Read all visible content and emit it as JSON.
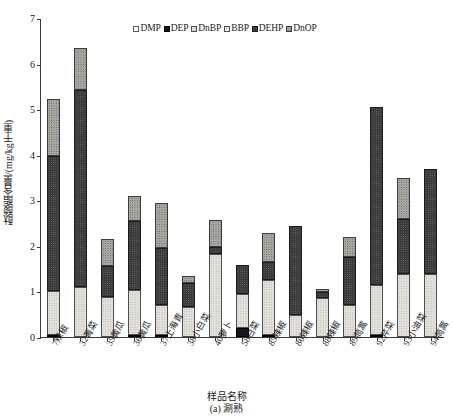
{
  "chart_data": {
    "type": "bar",
    "subtype": "stacked-bar",
    "title": "",
    "xlabel": "样品名称",
    "ylabel": "酞酸酯含量/(mg/kg干重)",
    "caption": "(a) 涮熟",
    "ylim": [
      0,
      7
    ],
    "yticks": [
      0,
      1,
      2,
      3,
      4,
      5,
      6,
      7
    ],
    "ytick_labels": [
      "0",
      "1",
      "2",
      "3",
      "4",
      "5",
      "6",
      "7"
    ],
    "grid": false,
    "legend_position": "top-center",
    "categories": [
      "7辣椒",
      "32菁菜",
      "35黄瓜",
      "36黄瓜",
      "37上海青",
      "38小白菜",
      "40萝卜",
      "58白菜",
      "85辣椒",
      "86辣椒",
      "88辣椒",
      "89茼蒿",
      "92芹菜",
      "93小油菜",
      "94茼蒿"
    ],
    "series": [
      {
        "name": "DMP",
        "swatch": "#fdfdfd",
        "values": [
          0,
          0,
          0,
          0,
          0,
          0,
          0,
          0,
          0,
          0,
          0,
          0,
          0,
          0,
          0
        ]
      },
      {
        "name": "DEP",
        "swatch": "#17171a",
        "values": [
          0.02,
          0,
          0,
          0.02,
          0.03,
          0,
          0,
          0.19,
          0.03,
          0,
          0,
          0,
          0.02,
          0,
          0
        ]
      },
      {
        "name": "DnBP",
        "swatch": "#e2e1dc",
        "values": [
          0.96,
          1.1,
          0.88,
          0.98,
          0.65,
          0.65,
          1.82,
          0.76,
          1.2,
          0.48,
          0.86,
          0.7,
          1.09,
          1.39,
          1.39
        ]
      },
      {
        "name": "BBP",
        "swatch": "#f2f1ed",
        "values": [
          0,
          0,
          0,
          0,
          0,
          0,
          0,
          0,
          0,
          0,
          0,
          0,
          0,
          0,
          0
        ]
      },
      {
        "name": "DEHP",
        "swatch": "#3b3b3e",
        "values": [
          2.97,
          4.32,
          0.68,
          1.53,
          1.26,
          0.54,
          0.15,
          0.62,
          0.41,
          1.96,
          0.12,
          1.05,
          3.92,
          1.21,
          2.29
        ]
      },
      {
        "name": "DnOP",
        "swatch": "#a8a7a2",
        "values": [
          1.25,
          0.93,
          0.59,
          0.54,
          0.99,
          0.15,
          0.59,
          0,
          0.64,
          0,
          0.08,
          0.45,
          0,
          0.9,
          0
        ]
      }
    ],
    "totals": [
      5.2,
      6.35,
      2.15,
      3.07,
      2.93,
      1.34,
      2.56,
      1.57,
      2.28,
      2.44,
      1.06,
      2.2,
      5.03,
      3.5,
      3.68
    ]
  }
}
